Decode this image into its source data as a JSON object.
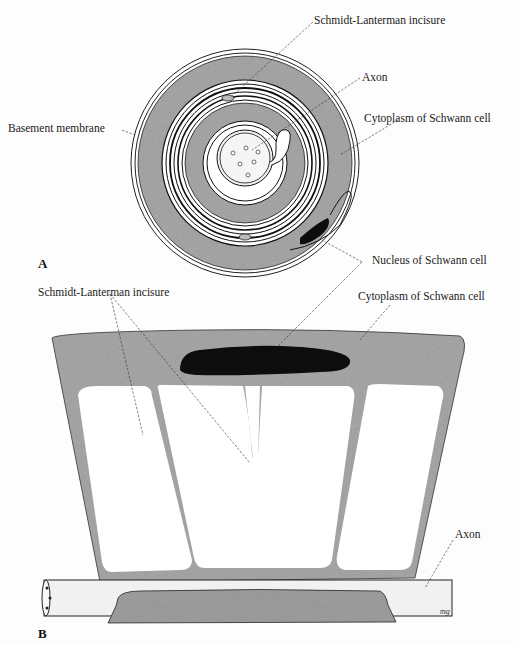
{
  "figure": {
    "panel_a": {
      "letter": "A",
      "labels": {
        "schmidt_lanterman": "Schmidt-Lanterman incisure",
        "axon": "Axon",
        "basement_membrane": "Basement membrane",
        "cytoplasm": "Cytoplasm of Schwann cell",
        "nucleus": "Nucleus of Schwann cell"
      }
    },
    "panel_b": {
      "letter": "B",
      "labels": {
        "schmidt_lanterman": "Schmidt-Lanterman incisure",
        "cytoplasm": "Cytoplasm of Schwann cell",
        "axon": "Axon"
      },
      "signature": "mg"
    },
    "colors": {
      "cytoplasm_gray": "#a9a9a9",
      "nucleus_black": "#0d0d0d",
      "membrane_white": "#ffffff",
      "outline": "#1a1a1a",
      "axon_fill": "#f1f1f1"
    }
  }
}
